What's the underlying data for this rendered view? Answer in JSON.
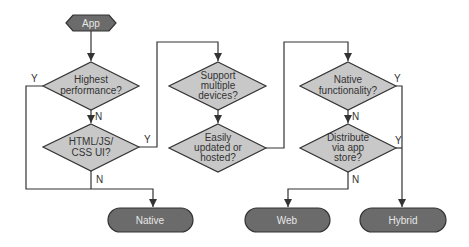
{
  "start": {
    "label": "App"
  },
  "decisions": [
    {
      "id": "highest-performance",
      "lines": [
        "Highest",
        "performance?"
      ]
    },
    {
      "id": "html-js-css-ui",
      "lines": [
        "HTML/JS/",
        "CSS UI?"
      ]
    },
    {
      "id": "support-multiple-devices",
      "lines": [
        "Support",
        "multiple",
        "devices?"
      ]
    },
    {
      "id": "easily-updated",
      "lines": [
        "Easily",
        "updated or",
        "hosted?"
      ]
    },
    {
      "id": "native-functionality",
      "lines": [
        "Native",
        "functionality?"
      ]
    },
    {
      "id": "distribute-app-store",
      "lines": [
        "Distribute",
        "via app",
        "store?"
      ]
    }
  ],
  "outcomes": [
    {
      "id": "native",
      "label": "Native"
    },
    {
      "id": "web",
      "label": "Web"
    },
    {
      "id": "hybrid",
      "label": "Hybrid"
    }
  ],
  "edge_labels": {
    "yes": "Y",
    "no": "N"
  },
  "colors": {
    "decision_fill": "#c8c8c8",
    "terminal_fill": "#6b6b6b",
    "line": "#333333",
    "terminal_text": "#e8e8e8"
  }
}
